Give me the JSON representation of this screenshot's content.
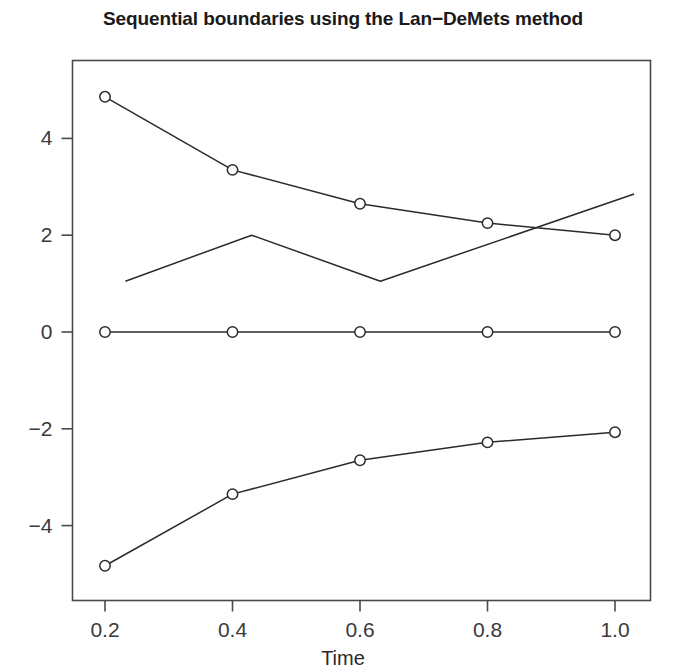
{
  "chart_data": {
    "type": "line",
    "title": "Sequential boundaries using the Lan−DeMets method",
    "subtitle": "",
    "xlabel": "Time",
    "ylabel": "",
    "xlim": [
      0.14,
      1.07
    ],
    "ylim": [
      -5.6,
      5.55
    ],
    "grid": false,
    "legend": "none",
    "xticks": [
      "0.2",
      "0.4",
      "0.6",
      "0.8",
      "1.0"
    ],
    "xtick_values": [
      0.2,
      0.4,
      0.6,
      0.8,
      1.0
    ],
    "yticks": [
      "4",
      "2",
      "0",
      "−2",
      "−4"
    ],
    "ytick_values": [
      4,
      2,
      0,
      -2,
      -4
    ],
    "x": [
      0.2,
      0.4,
      0.6,
      0.8,
      1.0
    ],
    "series": [
      {
        "name": "upper boundary",
        "marker": "circle",
        "values": [
          4.86,
          3.35,
          2.65,
          2.25,
          2.0
        ]
      },
      {
        "name": "null line",
        "marker": "circle",
        "values": [
          0.0,
          0.0,
          0.0,
          0.0,
          0.0
        ]
      },
      {
        "name": "lower boundary",
        "marker": "circle",
        "values": [
          -4.83,
          -3.35,
          -2.65,
          -2.28,
          -2.07
        ]
      },
      {
        "name": "observed statistic path",
        "marker": "none",
        "x": [
          0.232,
          0.43,
          0.632,
          1.03
        ],
        "values": [
          1.05,
          2.0,
          1.05,
          2.85
        ]
      }
    ]
  },
  "colors": {
    "line": "#2b2b2b",
    "axis": "#4a4a4a",
    "text": "#1a1a1a",
    "background": "#ffffff"
  }
}
